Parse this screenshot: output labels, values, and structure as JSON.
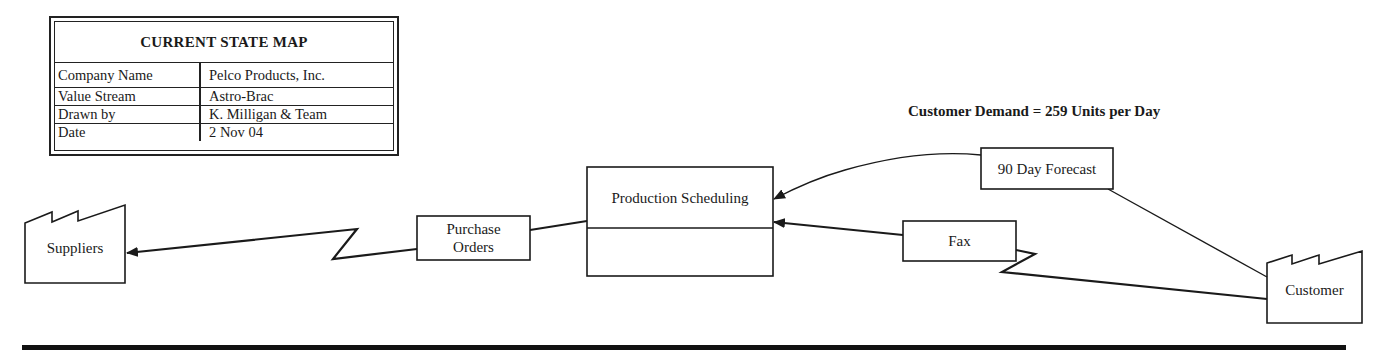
{
  "title_block": {
    "title": "CURRENT STATE MAP",
    "rows": [
      {
        "label": "Company Name",
        "value": "Pelco Products, Inc."
      },
      {
        "label": "Value Stream",
        "value": "Astro-Brac"
      },
      {
        "label": "Drawn by",
        "value": "K. Milligan & Team"
      },
      {
        "label": "Date",
        "value": "2 Nov 04"
      }
    ]
  },
  "customer_demand": "Customer Demand = 259 Units per Day",
  "nodes": {
    "suppliers": "Suppliers",
    "purchase_orders_line1": "Purchase",
    "purchase_orders_line2": "Orders",
    "production_scheduling": "Production Scheduling",
    "forecast": "90 Day Forecast",
    "fax": "Fax",
    "customer": "Customer"
  },
  "colors": {
    "stroke": "#1a1a1a",
    "background": "#ffffff"
  }
}
